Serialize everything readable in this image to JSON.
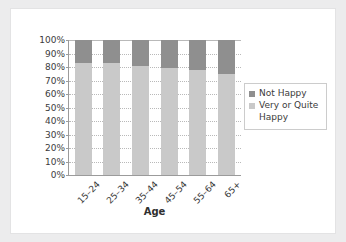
{
  "chart_data": {
    "type": "bar",
    "stacked": true,
    "stack_total": 100,
    "title": "",
    "subtitle": "",
    "xlabel": "Age",
    "ylabel": "",
    "categories": [
      "15–24",
      "25–34",
      "35–44",
      "45–54",
      "55–64",
      "65+"
    ],
    "series": [
      {
        "name": "Very or Quite Happy",
        "color": "#c9c9c9",
        "values": [
          83,
          83,
          81,
          79,
          78,
          75
        ]
      },
      {
        "name": "Not Happy",
        "color": "#8f8f8f",
        "values": [
          17,
          17,
          19,
          21,
          22,
          25
        ]
      }
    ],
    "legend_order": [
      "Not Happy",
      "Very or Quite Happy"
    ],
    "legend_position": "right",
    "ylim": [
      0,
      100
    ],
    "yticks": [
      "0%",
      "10%",
      "20%",
      "30%",
      "40%",
      "50%",
      "60%",
      "70%",
      "80%",
      "90%",
      "100%"
    ],
    "ytick_values": [
      0,
      10,
      20,
      30,
      40,
      50,
      60,
      70,
      80,
      90,
      100
    ],
    "grid": true,
    "grid_style": "dotted",
    "axis_color": "#9b9b9b",
    "background_color": "#ffffff",
    "frame_color": "#ececed"
  },
  "legend": {
    "items": [
      {
        "label": "Not Happy",
        "color": "#8f8f8f"
      },
      {
        "label": "Very or Quite",
        "color": "#c9c9c9"
      },
      {
        "label": "Happy",
        "color": ""
      }
    ]
  },
  "axis": {
    "x_title": "Age"
  }
}
